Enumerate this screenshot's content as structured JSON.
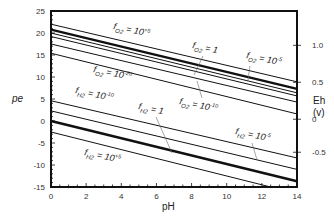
{
  "chart_data": {
    "type": "line",
    "title": "",
    "xlabel": "pH",
    "ylabel": "pe",
    "y2label": "Eh",
    "y2unit": "(v)",
    "xlim": [
      0,
      14
    ],
    "ylim": [
      -15,
      25
    ],
    "xticks": [
      "0",
      "2",
      "4",
      "6",
      "8",
      "10",
      "12",
      "14"
    ],
    "yticks": [
      "25",
      "20",
      "15",
      "10",
      "5",
      "0",
      "-5",
      "-10",
      "-15"
    ],
    "y2ticks": [
      {
        "label": "1.0",
        "pe": 17.2
      },
      {
        "label": "0.5",
        "pe": 8.8
      },
      {
        "label": "0",
        "pe": 0.4
      },
      {
        "label": "-0.5",
        "pe": -7.1
      }
    ],
    "series": [
      {
        "name": "fO2 = 10^+5",
        "x": [
          0,
          14
        ],
        "values": [
          22.0,
          8.9
        ],
        "width": 1
      },
      {
        "name": "fO2 = 1 (water upper limit)",
        "x": [
          0,
          14
        ],
        "values": [
          20.75,
          7.3
        ],
        "width": 2.4
      },
      {
        "name": "fO2 = 10^-5",
        "x": [
          0,
          14
        ],
        "values": [
          20.0,
          6.4
        ],
        "width": 1
      },
      {
        "name": "fO2 line",
        "x": [
          0,
          14
        ],
        "values": [
          19.2,
          5.7
        ],
        "width": 1
      },
      {
        "name": "fO2 = 10^-10",
        "x": [
          0,
          14
        ],
        "values": [
          17.5,
          4.3
        ],
        "width": 1
      },
      {
        "name": "fO2 = 10^-20",
        "x": [
          0,
          14
        ],
        "values": [
          15.4,
          1.6
        ],
        "width": 1
      },
      {
        "name": "fH2 = 10^-10",
        "x": [
          0,
          14
        ],
        "values": [
          4.6,
          -8.4
        ],
        "width": 1
      },
      {
        "name": "fH2 = 10^-5",
        "x": [
          0,
          14
        ],
        "values": [
          2.3,
          -11.0
        ],
        "width": 1
      },
      {
        "name": "fH2 = 1 (water lower limit)",
        "x": [
          0,
          14
        ],
        "values": [
          0.0,
          -13.7
        ],
        "width": 2.4
      },
      {
        "name": "fH2 = 10^+5",
        "x": [
          0,
          12.5
        ],
        "values": [
          -2.5,
          -15.0
        ],
        "width": 1
      }
    ],
    "annotations": [
      {
        "f": "f",
        "sub": "O2",
        "eq": " = 10",
        "exp": "+5",
        "x": 113,
        "y": 29
      },
      {
        "f": "f",
        "sub": "O2",
        "eq": " = 1",
        "exp": "",
        "x": 192,
        "y": 48
      },
      {
        "f": "f",
        "sub": "O2",
        "eq": " = 10",
        "exp": "-5",
        "x": 246,
        "y": 58
      },
      {
        "f": "f",
        "sub": "O2",
        "eq": " = 10",
        "exp": "-20",
        "x": 93,
        "y": 72
      },
      {
        "f": "f",
        "sub": "O2",
        "eq": " = 10",
        "exp": "-10",
        "x": 179,
        "y": 104
      },
      {
        "f": "f",
        "sub": "H2",
        "eq": " = 10",
        "exp": "-10",
        "x": 75,
        "y": 93
      },
      {
        "f": "f",
        "sub": "H2",
        "eq": " = 1",
        "exp": "",
        "x": 138,
        "y": 109
      },
      {
        "f": "f",
        "sub": "H2",
        "eq": " = 10",
        "exp": "-5",
        "x": 235,
        "y": 134
      },
      {
        "f": "f",
        "sub": "H2",
        "eq": " = 10",
        "exp": "+5",
        "x": 84,
        "y": 155
      }
    ],
    "grid": false
  }
}
